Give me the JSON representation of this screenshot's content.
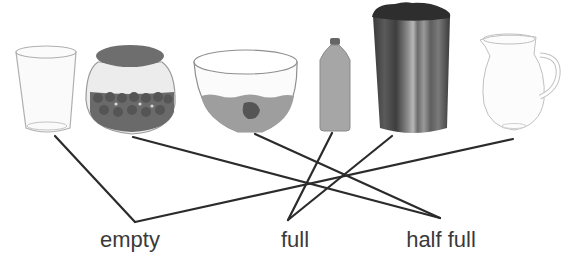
{
  "diagram": {
    "type": "matching-exercise",
    "objects": [
      {
        "id": "glass",
        "name": "drinking glass",
        "state": "empty",
        "anchor": [
          55,
          136
        ]
      },
      {
        "id": "jar",
        "name": "jar with candies",
        "state": "half full",
        "anchor": [
          133,
          137
        ]
      },
      {
        "id": "bowl",
        "name": "bowl with water and fish",
        "state": "half full",
        "anchor": [
          255,
          134
        ]
      },
      {
        "id": "bottle",
        "name": "water bottle",
        "state": "full",
        "anchor": [
          332,
          133
        ]
      },
      {
        "id": "can",
        "name": "can full of dirt",
        "state": "full",
        "anchor": [
          392,
          136
        ]
      },
      {
        "id": "pitcher",
        "name": "pitcher",
        "state": "empty",
        "anchor": [
          513,
          139
        ]
      }
    ],
    "labels": [
      {
        "id": "empty",
        "text": "empty",
        "x": 130,
        "y": 229,
        "anchor": [
          135,
          222
        ]
      },
      {
        "id": "full",
        "text": "full",
        "x": 295,
        "y": 229,
        "anchor": [
          288,
          220
        ]
      },
      {
        "id": "half_full",
        "text": "half full",
        "x": 441,
        "y": 229,
        "anchor": [
          440,
          218
        ]
      }
    ],
    "connections": [
      {
        "from": "glass",
        "to": "empty"
      },
      {
        "from": "jar",
        "to": "half_full"
      },
      {
        "from": "bowl",
        "to": "half_full"
      },
      {
        "from": "bottle",
        "to": "full"
      },
      {
        "from": "can",
        "to": "full"
      },
      {
        "from": "pitcher",
        "to": "empty"
      }
    ],
    "colors": {
      "line": "#2b2b2b",
      "text": "#3a3a3a",
      "outline": "#a8a8a8",
      "fill_mid": "#9a9a9a",
      "fill_dark": "#555555"
    }
  }
}
